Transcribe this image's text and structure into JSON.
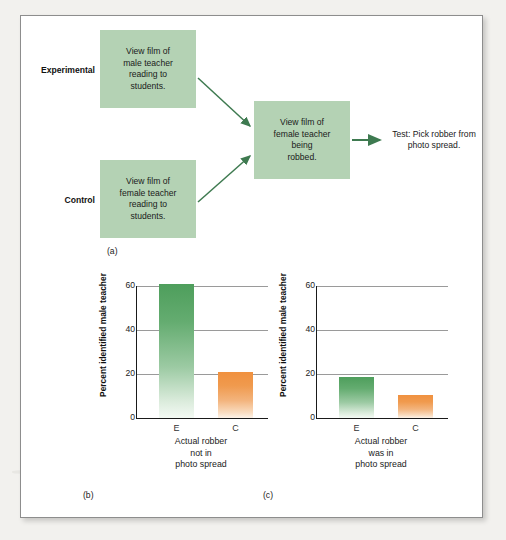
{
  "figure": {
    "panel_a": {
      "caption": "(a)",
      "group_labels": {
        "experimental": "Experimental",
        "control": "Control"
      },
      "boxes": {
        "experimental": "View film of male teacher reading to students.",
        "control": "View film of female teacher reading to students.",
        "robbed": "View film of female teacher being robbed.",
        "test": "Test: Pick robber from photo spread."
      },
      "box_lines": {
        "experimental": [
          "View film of",
          "male teacher",
          "reading to",
          "students."
        ],
        "control": [
          "View film of",
          "female teacher",
          "reading to",
          "students."
        ],
        "robbed": [
          "View film of",
          "female teacher",
          "being",
          "robbed."
        ],
        "test": [
          "Test:",
          "Pick robber",
          "from",
          "photo spread."
        ]
      },
      "colors": {
        "box_fill": "#b4d2b4",
        "arrow": "#3e7a50",
        "text": "#1a1a1a"
      }
    }
  },
  "chart_data": [
    {
      "id": "b",
      "type": "bar",
      "caption": "(b)",
      "title": "",
      "categories": [
        "E",
        "C"
      ],
      "values": [
        61,
        21
      ],
      "xlabel": "Actual robber not in photo spread",
      "xlabel_lines": [
        "Actual robber",
        "not in",
        "photo spread"
      ],
      "ylabel": "Percent identified male teacher",
      "ylim": [
        0,
        60
      ],
      "yticks": [
        0,
        20,
        40,
        60
      ],
      "grid": true,
      "legend": "none",
      "bar_colors": [
        "#4e9e5c",
        "#f0913f"
      ]
    },
    {
      "id": "c",
      "type": "bar",
      "caption": "(c)",
      "title": "",
      "categories": [
        "E",
        "C"
      ],
      "values": [
        18.5,
        10.5
      ],
      "xlabel": "Actual robber was in photo spread",
      "xlabel_lines": [
        "Actual robber",
        "was in",
        "photo spread"
      ],
      "ylabel": "Percent identified male teacher",
      "ylim": [
        0,
        60
      ],
      "yticks": [
        0,
        20,
        40,
        60
      ],
      "grid": true,
      "legend": "none",
      "bar_colors": [
        "#4e9e5c",
        "#f0913f"
      ]
    }
  ]
}
